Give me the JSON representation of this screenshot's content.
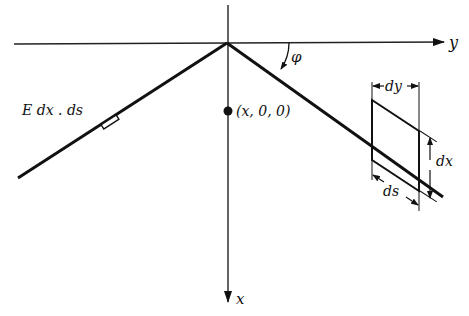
{
  "diagram": {
    "axes": {
      "y_label": "y",
      "x_label": "x"
    },
    "angle_label": "φ",
    "point_label": "(x, 0, 0)",
    "charge_label": "E dx . ds",
    "element": {
      "dy_label": "dy",
      "dx_label": "dx",
      "ds_label": "ds"
    },
    "colors": {
      "ink": "#111111",
      "background": "#ffffff"
    }
  }
}
